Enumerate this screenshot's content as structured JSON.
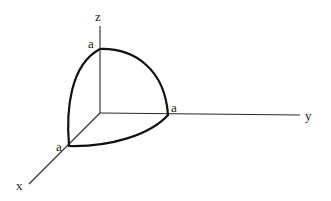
{
  "diagram": {
    "axes": {
      "x": {
        "label": "x"
      },
      "y": {
        "label": "y"
      },
      "z": {
        "label": "z"
      }
    },
    "intercepts": {
      "x": {
        "label": "a"
      },
      "y": {
        "label": "a"
      },
      "z": {
        "label": "a"
      }
    },
    "colors": {
      "axis": "#2a2a2a",
      "curve": "#111111",
      "background": "#ffffff"
    }
  }
}
